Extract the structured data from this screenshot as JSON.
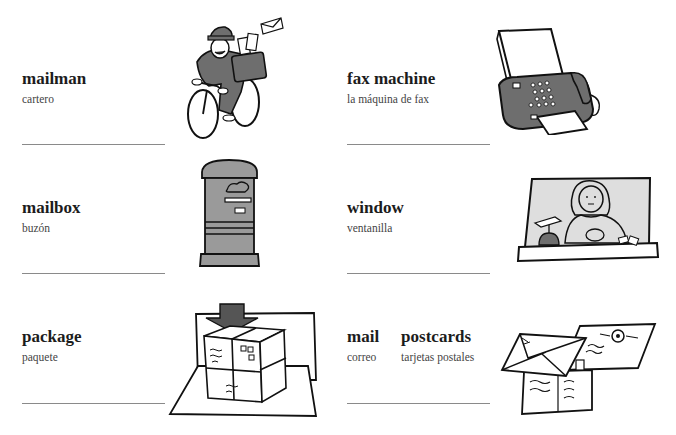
{
  "entries": [
    {
      "term": "mailman",
      "translation": "cartero",
      "illustration": "mailman-on-bicycle"
    },
    {
      "term": "fax machine",
      "translation": "la máquina de fax",
      "illustration": "fax-machine"
    },
    {
      "term": "mailbox",
      "translation": "buzón",
      "illustration": "mailbox"
    },
    {
      "term": "window",
      "translation": "ventanilla",
      "illustration": "post-office-window-clerk"
    },
    {
      "term": "package",
      "translation": "paquete",
      "illustration": "package"
    },
    {
      "term": "mail",
      "translation": "correo",
      "illustration": "mail-envelopes"
    },
    {
      "term": "postcards",
      "translation": "tarjetas postales",
      "illustration": "postcards"
    }
  ],
  "colors": {
    "dark_fill": "#6e6e6e",
    "mid_fill": "#9a9a9a",
    "light_fill": "#dedede",
    "rule": "#8a8a8a"
  }
}
